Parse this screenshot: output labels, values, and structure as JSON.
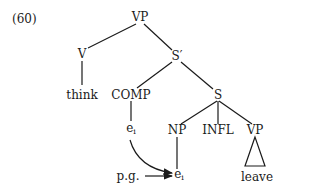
{
  "example_number": "(60)",
  "nodes": {
    "vp_root": "VP",
    "v": "V",
    "sbar": "S′",
    "think": "think",
    "comp": "COMP",
    "s": "S",
    "comp_trace": "e",
    "comp_trace_index": "i",
    "np": "NP",
    "infl": "INFL",
    "vp_lower": "VP",
    "np_trace": "e",
    "np_trace_index": "i",
    "leave": "leave",
    "pg": "p.g."
  }
}
